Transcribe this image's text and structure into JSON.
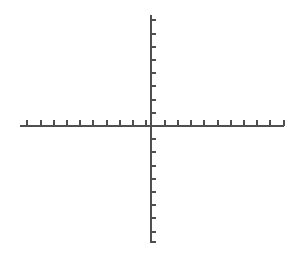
{
  "figure": {
    "title": "",
    "background_color": "#ffffff",
    "width": 301,
    "height": 259
  },
  "chart_data": {
    "type": "line",
    "title": "",
    "subtitle": "",
    "xlabel": "",
    "ylabel": "",
    "series": [],
    "x": [],
    "categories": [],
    "values": [],
    "grid": false,
    "legend": false,
    "legend_position": "none",
    "annotations": [],
    "tick_labels": {
      "x": [],
      "y": []
    },
    "xlim": [
      -10,
      10
    ],
    "ylim": [
      -9,
      8
    ],
    "origin": {
      "x": 151,
      "y": 126
    },
    "axes": {
      "x_axis": {
        "name": "x-axis",
        "start_px": 20,
        "end_px": 284,
        "y_px": 126,
        "thickness_px": 2,
        "color": "#4f4f4f"
      },
      "y_axis": {
        "name": "y-axis",
        "start_px": 15,
        "end_px": 243,
        "x_px": 151,
        "thickness_px": 2,
        "color": "#4f4f4f"
      }
    },
    "ticks": {
      "spacing_px": 13.2,
      "length_px": 5,
      "thickness_px": 2,
      "color": "#4f4f4f",
      "x_direction": "up",
      "y_direction": "right",
      "x_count_left": 10,
      "x_count_right": 10,
      "y_count_above": 8,
      "y_count_below": 9,
      "x_positions_px": [
        27.4,
        40.6,
        53.8,
        67.0,
        80.2,
        93.4,
        106.6,
        119.8,
        133.0,
        146.2,
        164.8,
        178.0,
        191.2,
        204.4,
        217.6,
        230.8,
        244.0,
        257.2,
        270.4,
        283.6
      ],
      "y_positions_px": [
        20.4,
        33.6,
        46.8,
        60.0,
        73.2,
        86.4,
        99.6,
        112.8,
        139.2,
        152.4,
        165.6,
        178.8,
        192.0,
        205.2,
        218.4,
        231.6,
        242.0
      ]
    },
    "colors": {
      "axis": "#4f4f4f",
      "tick": "#4f4f4f",
      "background": "#ffffff"
    }
  }
}
